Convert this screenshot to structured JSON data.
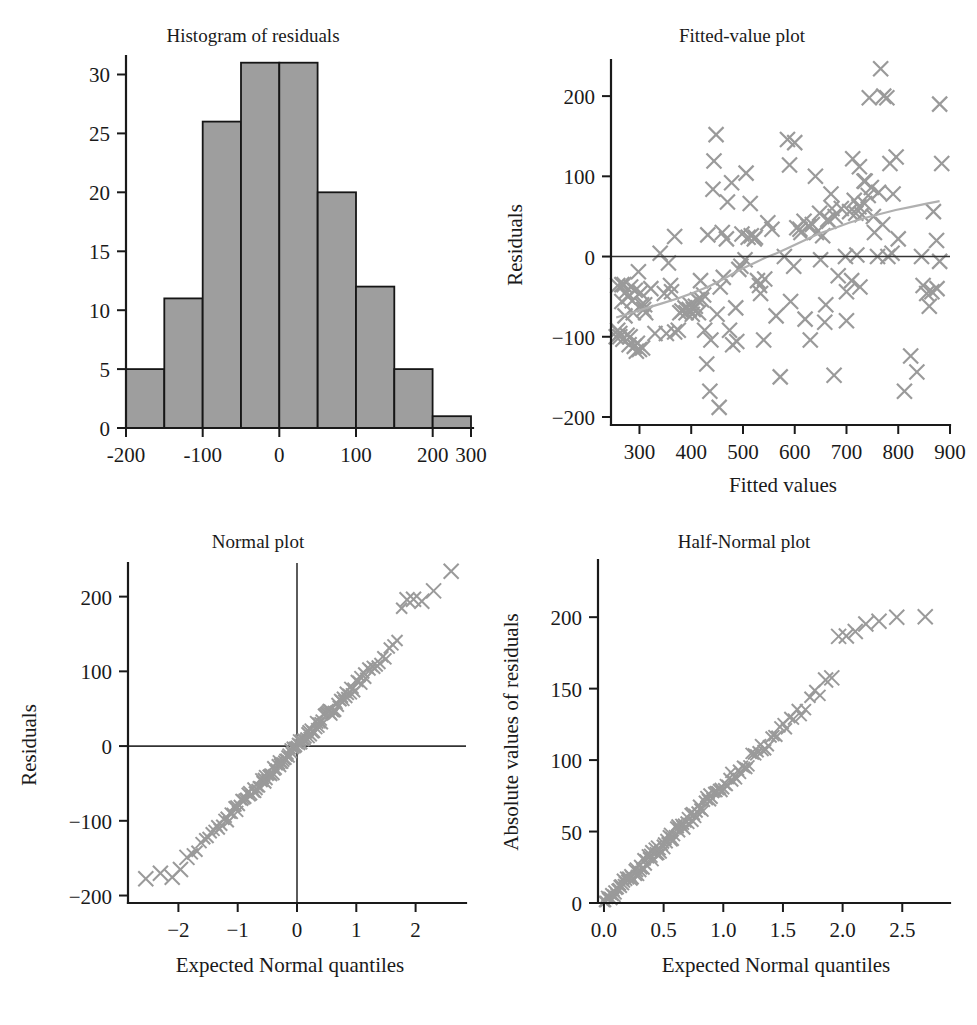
{
  "figure": {
    "background": "#ffffff",
    "marker_color": "#9a9a9a",
    "bar_fill": "#9e9e9e",
    "bar_stroke": "#161616",
    "axis_color": "#1a1a1a",
    "loess_color": "#b0b0b0"
  },
  "panels": {
    "histogram": {
      "title": "Histogram of residuals",
      "xlabel": "",
      "ylabel": "",
      "xticks": [
        "-200",
        "-100",
        "0",
        "100",
        "200",
        "300"
      ],
      "yticks": [
        "0",
        "5",
        "10",
        "15",
        "20",
        "25",
        "30"
      ]
    },
    "fitted": {
      "title": "Fitted-value plot",
      "xlabel": "Fitted values",
      "ylabel": "Residuals",
      "xticks": [
        "300",
        "400",
        "500",
        "600",
        "700",
        "800",
        "900"
      ],
      "yticks": [
        "-200",
        "-100",
        "0",
        "100",
        "200"
      ]
    },
    "normal": {
      "title": "Normal plot",
      "xlabel": "Expected Normal quantiles",
      "ylabel": "Residuals",
      "xticks": [
        "-2",
        "-1",
        "0",
        "1",
        "2"
      ],
      "yticks": [
        "-200",
        "-100",
        "0",
        "100",
        "200"
      ]
    },
    "halfnormal": {
      "title": "Half-Normal plot",
      "xlabel": "Expected Normal quantiles",
      "ylabel": "Absolute values of residuals",
      "xticks": [
        "0.0",
        "0.5",
        "1.0",
        "1.5",
        "2.0",
        "2.5"
      ],
      "yticks": [
        "0",
        "50",
        "100",
        "150",
        "200"
      ]
    }
  },
  "chart_data": [
    {
      "type": "bar",
      "id": "histogram-of-residuals",
      "title": "Histogram of residuals",
      "xlabel": "",
      "ylabel": "",
      "grid": false,
      "legend": "none",
      "bin_width": 50,
      "bin_edges": [
        -200,
        -150,
        -100,
        -50,
        0,
        50,
        100,
        150,
        200,
        250
      ],
      "categories": [
        "-200..-150",
        "-150..-100",
        "-100..-50",
        "-50..0",
        "0..50",
        "50..100",
        "100..150",
        "150..200",
        "200..250"
      ],
      "values": [
        5,
        11,
        26,
        31,
        31,
        20,
        12,
        5,
        1
      ],
      "xlim": [
        -210,
        310
      ],
      "ylim": [
        0,
        32
      ],
      "xticks": [
        -200,
        -100,
        0,
        100,
        200,
        300
      ],
      "yticks": [
        0,
        5,
        10,
        15,
        20,
        25,
        30
      ]
    },
    {
      "type": "scatter",
      "id": "fitted-value-plot",
      "title": "Fitted-value plot",
      "xlabel": "Fitted values",
      "ylabel": "Residuals",
      "grid": false,
      "legend": "none",
      "xlim": [
        245,
        900
      ],
      "ylim": [
        -210,
        245
      ],
      "xticks": [
        300,
        400,
        500,
        600,
        700,
        800,
        900
      ],
      "yticks": [
        -200,
        -100,
        0,
        100,
        200
      ],
      "annotations": [
        {
          "kind": "hline",
          "y": 0,
          "label": "zero reference line"
        },
        {
          "kind": "loess",
          "label": "smoothed trend curve"
        }
      ],
      "loess": [
        [
          255,
          -76
        ],
        [
          285,
          -70
        ],
        [
          315,
          -64
        ],
        [
          345,
          -58
        ],
        [
          375,
          -52
        ],
        [
          405,
          -45
        ],
        [
          435,
          -37
        ],
        [
          465,
          -27
        ],
        [
          495,
          -16
        ],
        [
          525,
          -7
        ],
        [
          545,
          -1
        ],
        [
          565,
          4
        ],
        [
          585,
          10
        ],
        [
          615,
          19
        ],
        [
          645,
          28
        ],
        [
          675,
          35
        ],
        [
          705,
          42
        ],
        [
          735,
          48
        ],
        [
          765,
          53
        ],
        [
          795,
          58
        ],
        [
          825,
          62
        ],
        [
          855,
          66
        ],
        [
          880,
          69
        ]
      ],
      "x": [
        255,
        258,
        262,
        266,
        268,
        272,
        276,
        280,
        283,
        286,
        290,
        294,
        298,
        302,
        306,
        310,
        262,
        270,
        278,
        288,
        296,
        304,
        258,
        266,
        274,
        282,
        292,
        300,
        308,
        312,
        322,
        330,
        340,
        348,
        356,
        362,
        368,
        375,
        382,
        390,
        396,
        402,
        408,
        414,
        420,
        426,
        432,
        438,
        444,
        450,
        352,
        360,
        368,
        378,
        388,
        398,
        404,
        412,
        418,
        424,
        430,
        436,
        442,
        448,
        454,
        456,
        462,
        468,
        474,
        480,
        486,
        492,
        498,
        504,
        510,
        516,
        522,
        528,
        534,
        540,
        460,
        470,
        478,
        488,
        496,
        506,
        514,
        524,
        532,
        542,
        548,
        556,
        564,
        572,
        580,
        586,
        592,
        598,
        604,
        612,
        618,
        626,
        634,
        642,
        648,
        654,
        660,
        666,
        672,
        678,
        590,
        600,
        610,
        620,
        630,
        640,
        650,
        658,
        664,
        670,
        676,
        684,
        690,
        698,
        706,
        712,
        718,
        724,
        730,
        736,
        742,
        748,
        754,
        760,
        766,
        772,
        778,
        784,
        790,
        796,
        700,
        710,
        720,
        726,
        734,
        744,
        752,
        762,
        770,
        780,
        788,
        800,
        812,
        824,
        836,
        848,
        860,
        868,
        874,
        880,
        884,
        845,
        855,
        865,
        875,
        880,
        700,
        715,
        725,
        735
      ],
      "y": [
        -100,
        -36,
        -96,
        -35,
        -103,
        -74,
        -98,
        -110,
        -38,
        -55,
        -112,
        -118,
        -19,
        -45,
        -114,
        -60,
        -100,
        -35,
        -50,
        -70,
        -108,
        -60,
        -92,
        -56,
        -44,
        -100,
        -42,
        -116,
        -66,
        -70,
        -40,
        -96,
        4,
        -46,
        -8,
        -44,
        -94,
        -92,
        -68,
        -70,
        -66,
        -72,
        -62,
        -70,
        -54,
        -92,
        27,
        -104,
        119,
        -72,
        -96,
        -36,
        25,
        -70,
        -64,
        -60,
        -66,
        -54,
        -30,
        -48,
        -134,
        -168,
        84,
        152,
        -188,
        -38,
        -26,
        22,
        -92,
        -110,
        -64,
        -16,
        28,
        -4,
        24,
        26,
        22,
        -30,
        -46,
        -104,
        30,
        68,
        92,
        -106,
        -12,
        104,
        66,
        24,
        -36,
        -28,
        42,
        34,
        -74,
        -150,
        0,
        146,
        -56,
        -12,
        36,
        30,
        44,
        38,
        40,
        30,
        54,
        26,
        -60,
        44,
        60,
        50,
        114,
        142,
        34,
        -78,
        -104,
        100,
        -4,
        -82,
        46,
        78,
        -148,
        -24,
        60,
        0,
        56,
        122,
        54,
        62,
        52,
        94,
        76,
        86,
        30,
        0,
        234,
        200,
        198,
        116,
        78,
        124,
        -44,
        -30,
        2,
        -38,
        94,
        198,
        50,
        80,
        40,
        0,
        4,
        22,
        -168,
        -124,
        -144,
        -36,
        -62,
        56,
        20,
        190,
        116,
        0,
        -46,
        -44,
        -40,
        -6,
        -80,
        70,
        112,
        66
      ]
    },
    {
      "type": "scatter",
      "id": "normal-plot",
      "title": "Normal plot",
      "xlabel": "Expected Normal quantiles",
      "ylabel": "Residuals",
      "grid": false,
      "legend": "none",
      "xlim": [
        -2.85,
        2.85
      ],
      "ylim": [
        -210,
        245
      ],
      "xticks": [
        -2,
        -1,
        0,
        1,
        2
      ],
      "yticks": [
        -200,
        -100,
        0,
        100,
        200
      ],
      "annotations": [
        {
          "kind": "hline",
          "y": 0,
          "label": "zero residual line"
        },
        {
          "kind": "vline",
          "x": 0,
          "label": "zero quantile line"
        }
      ],
      "n_points": 142,
      "description": "Normal QQ plot of residuals; points fall close to a straight line from (-2.55,-186) to (2.6,234)",
      "quantile_endpoints": [
        [
          -2.55,
          -186
        ],
        [
          2.6,
          234
        ]
      ],
      "sd_estimate": 82
    },
    {
      "type": "scatter",
      "id": "half-normal-plot",
      "title": "Half-Normal plot",
      "xlabel": "Expected Normal quantiles",
      "ylabel": "Absolute values of residuals",
      "grid": false,
      "legend": "none",
      "xlim": [
        -0.05,
        2.9
      ],
      "ylim": [
        0,
        240
      ],
      "xticks": [
        0.0,
        0.5,
        1.0,
        1.5,
        2.0,
        2.5
      ],
      "yticks": [
        0,
        50,
        100,
        150,
        200
      ],
      "n_points": 142,
      "description": "Half-normal plot of absolute residuals rising nearly linearly from origin to (2.8,234)",
      "quantile_endpoints": [
        [
          0.01,
          2
        ],
        [
          2.8,
          234
        ]
      ],
      "sd_estimate": 82
    }
  ]
}
